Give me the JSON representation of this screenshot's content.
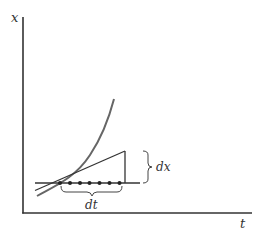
{
  "diagram": {
    "title": "",
    "axes": {
      "y_label": "x",
      "x_label": "t"
    },
    "annotations": {
      "horizontal_increment": "dt",
      "vertical_increment": "dx"
    },
    "elements": {
      "curve": "increasing convex curve x(t)",
      "tangent": "tangent line at the point on the curve",
      "dots_count": 7
    },
    "colors": {
      "axes": "#333333",
      "curve": "#666666",
      "lines": "#333333",
      "text": "#333333"
    }
  }
}
